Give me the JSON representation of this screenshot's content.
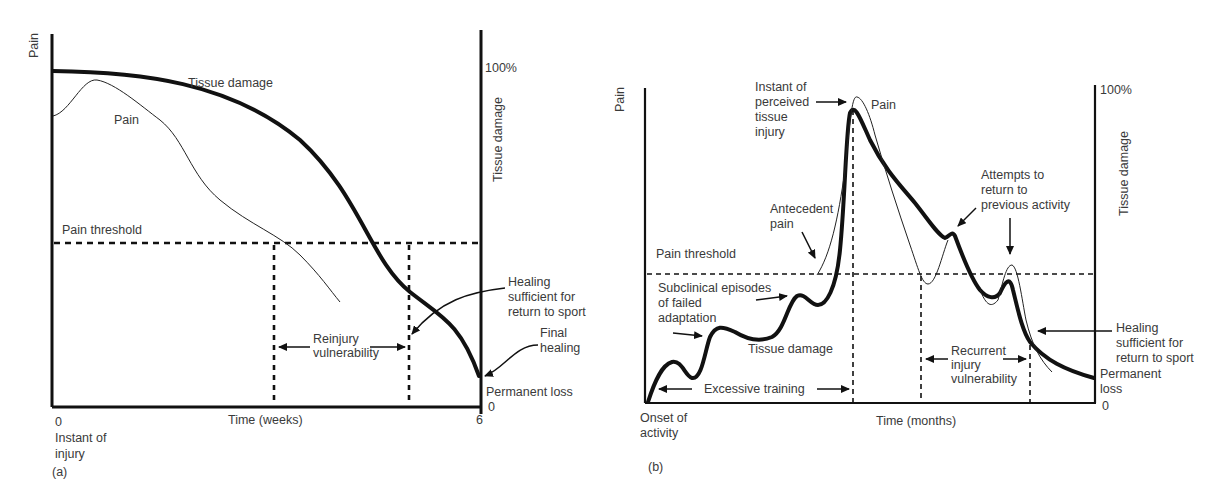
{
  "panel_a": {
    "caption": "(a)",
    "y_left_label": "Pain",
    "y_right_label": "Tissue damage",
    "y_right_top_tick": "100%",
    "y_right_bottom_tick": "0",
    "x_label": "Time (weeks)",
    "x_start_tick": "0",
    "x_end_tick": "6",
    "x_start_note_line1": "Instant of",
    "x_start_note_line2": "injury",
    "curve_tissue_label": "Tissue damage",
    "curve_pain_label": "Pain",
    "threshold_label": "Pain threshold",
    "reinjury_line1": "Reinjury",
    "reinjury_line2": "vulnerability",
    "healing_sport_line1": "Healing",
    "healing_sport_line2": "sufficient for",
    "healing_sport_line3": "return to sport",
    "final_healing_line1": "Final",
    "final_healing_line2": "healing",
    "permanent_loss": "Permanent loss"
  },
  "panel_b": {
    "caption": "(b)",
    "y_left_label": "Pain",
    "y_right_label": "Tissue damage",
    "y_right_top_tick": "100%",
    "y_right_bottom_tick": "0",
    "x_label": "Time (months)",
    "x_start_note_line1": "Onset of",
    "x_start_note_line2": "activity",
    "perceived_line1": "Instant of",
    "perceived_line2": "perceived",
    "perceived_line3": "tissue",
    "perceived_line4": "injury",
    "curve_pain_label": "Pain",
    "curve_tissue_label": "Tissue damage",
    "threshold_label": "Pain threshold",
    "antecedent_line1": "Antecedent",
    "antecedent_line2": "pain",
    "subclinical_line1": "Subclinical episodes",
    "subclinical_line2": "of failed",
    "subclinical_line3": "adaptation",
    "excessive_training": "Excessive training",
    "attempts_line1": "Attempts to",
    "attempts_line2": "return to",
    "attempts_line3": "previous activity",
    "recurrent_line1": "Recurrent",
    "recurrent_line2": "injury",
    "recurrent_line3": "vulnerability",
    "healing_sport_line1": "Healing",
    "healing_sport_line2": "sufficient for",
    "healing_sport_line3": "return to sport",
    "permanent_loss_line1": "Permanent",
    "permanent_loss_line2": "loss"
  }
}
